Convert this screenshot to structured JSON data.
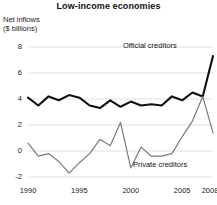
{
  "chart_data": {
    "type": "line",
    "title": "Low-income economies",
    "subtitle": "",
    "ylabel": "Net inflows\n($ billions)",
    "xlabel": "",
    "ylim": [
      -2,
      8
    ],
    "xlim": [
      1990,
      2008
    ],
    "grid": true,
    "legend_position": "inline-annotation",
    "y_ticks": [
      "8",
      "6",
      "4",
      "2",
      "0",
      "-2"
    ],
    "y_tick_values": [
      8,
      6,
      4,
      2,
      0,
      -2
    ],
    "x_ticks": [
      "1990",
      "1995",
      "2000",
      "2005",
      "2008"
    ],
    "x_tick_values": [
      1990,
      1995,
      2000,
      2005,
      2008
    ],
    "x": [
      1990,
      1991,
      1992,
      1993,
      1994,
      1995,
      1996,
      1997,
      1998,
      1999,
      2000,
      2001,
      2002,
      2003,
      2004,
      2005,
      2006,
      2007,
      2008
    ],
    "series": [
      {
        "name": "Official creditors",
        "color": "#111111",
        "values": [
          4.1,
          3.5,
          4.2,
          3.9,
          4.3,
          4.1,
          3.5,
          3.3,
          3.9,
          3.4,
          3.8,
          3.5,
          3.6,
          3.5,
          4.2,
          3.9,
          4.5,
          4.2,
          7.3
        ]
      },
      {
        "name": "Private creditors",
        "color": "#7a7a7a",
        "values": [
          0.6,
          -0.4,
          -0.2,
          -0.8,
          -1.7,
          -0.9,
          -0.2,
          0.9,
          0.4,
          2.2,
          -1.3,
          0.3,
          -0.4,
          -0.4,
          -0.2,
          1.1,
          2.3,
          4.2,
          1.4
        ]
      }
    ],
    "annotations": [
      {
        "text": "Official creditors",
        "series": "Official creditors"
      },
      {
        "text": "Private creditors",
        "series": "Private creditors"
      }
    ]
  },
  "figure": {
    "title": "Low-income economies",
    "y_axis_title": "Net inflows\n($ billions)",
    "y_labels": [
      "8",
      "6",
      "4",
      "2",
      "0",
      "-2"
    ],
    "x_labels": [
      "1990",
      "1995",
      "2000",
      "2005",
      "2008"
    ],
    "official_label": "Official creditors",
    "private_label": "Private creditors",
    "colors": {
      "official": "#111111",
      "private": "#7a7a7a",
      "grid": "#d8d8d8",
      "background": "#ffffff",
      "text": "#1b1b1b"
    }
  }
}
